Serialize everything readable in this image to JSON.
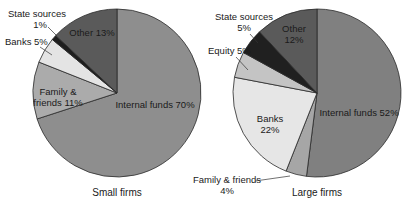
{
  "chart_data": [
    {
      "type": "pie",
      "title": "Small firms",
      "categories": [
        "Internal funds",
        "Family & friends",
        "Banks",
        "State sources",
        "Other"
      ],
      "values": [
        70,
        11,
        5,
        1,
        13
      ],
      "labels": [
        "Internal funds 70%",
        "Family & friends 11%",
        "Banks 5%",
        "State sources 1%",
        "Other 13%"
      ],
      "colors": [
        "#8e8e8e",
        "#ababab",
        "#e4e4e4",
        "#1e1e1e",
        "#5a5a5a"
      ]
    },
    {
      "type": "pie",
      "title": "Large firms",
      "categories": [
        "Internal funds",
        "Family & friends",
        "Banks",
        "Equity",
        "State sources",
        "Other"
      ],
      "values": [
        52,
        4,
        22,
        5,
        5,
        12
      ],
      "labels": [
        "Internal funds 52%",
        "Family & friends 4%",
        "Banks 22%",
        "Equity 5%",
        "State sources 5%",
        "Other 12%"
      ],
      "colors": [
        "#808080",
        "#a6a6a6",
        "#e6e6e6",
        "#c4c4c4",
        "#202020",
        "#5a5a5a"
      ]
    }
  ],
  "small": {
    "caption": "Small firms",
    "internal": "Internal funds 70%",
    "family_1": "Family &",
    "family_2": "friends 11%",
    "banks": "Banks 5%",
    "state_1": "State sources",
    "state_2": "1%",
    "other": "Other 13%"
  },
  "large": {
    "caption": "Large firms",
    "internal": "Internal funds 52%",
    "banks_1": "Banks",
    "banks_2": "22%",
    "equity": "Equity 5%",
    "state_1": "State sources",
    "state_2": "5%",
    "other_1": "Other",
    "other_2": "12%",
    "family_1": "Family & friends",
    "family_2": "4%"
  }
}
